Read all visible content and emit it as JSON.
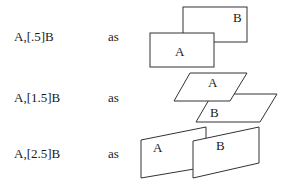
{
  "rows": [
    {
      "expression": "A,[.5]B",
      "connector": "as",
      "shape_a_label": "A",
      "shape_b_label": "B"
    },
    {
      "expression": "A,[1.5]B",
      "connector": "as",
      "shape_a_label": "A",
      "shape_b_label": "B"
    },
    {
      "expression": "A,[2.5]B",
      "connector": "as",
      "shape_a_label": "A",
      "shape_b_label": "B"
    }
  ]
}
